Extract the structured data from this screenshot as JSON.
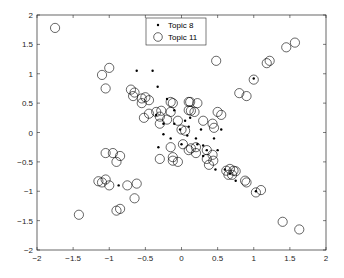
{
  "chart_data": {
    "type": "scatter",
    "title": "",
    "xlabel": "",
    "ylabel": "",
    "xlim": [
      -2,
      2
    ],
    "ylim": [
      -2,
      2
    ],
    "xticks": [
      "-2",
      "-1.5",
      "-1",
      "-0.5",
      "0",
      "0.5",
      "1",
      "1.5",
      "2"
    ],
    "yticks": [
      "-2",
      "-1.5",
      "-1",
      "-0.5",
      "0",
      "0.5",
      "1",
      "1.5",
      "2"
    ],
    "grid": false,
    "legend_position": "top-center",
    "series": [
      {
        "name": "Topic 8",
        "marker": "dot",
        "points": [
          [
            -0.62,
            1.05
          ],
          [
            -0.4,
            1.05
          ],
          [
            -0.33,
            0.78
          ],
          [
            -0.2,
            0.57
          ],
          [
            -0.1,
            0.38
          ],
          [
            -0.35,
            0.3
          ],
          [
            -0.25,
            0.15
          ],
          [
            -0.1,
            0.15
          ],
          [
            0.05,
            0.2
          ],
          [
            0.1,
            0.1
          ],
          [
            -0.25,
            -0.03
          ],
          [
            0.08,
            -0.05
          ],
          [
            0.2,
            -0.1
          ],
          [
            0.27,
            0.05
          ],
          [
            0.22,
            -0.2
          ],
          [
            0.3,
            -0.22
          ],
          [
            0.35,
            -0.3
          ],
          [
            0.45,
            -0.1
          ],
          [
            0.55,
            0.05
          ],
          [
            0.5,
            -0.3
          ],
          [
            0.3,
            -0.4
          ],
          [
            0.47,
            -0.63
          ],
          [
            0.6,
            -0.63
          ],
          [
            0.67,
            -0.7
          ],
          [
            0.75,
            -0.82
          ],
          [
            1.03,
            -1.0
          ],
          [
            1.0,
            0.92
          ],
          [
            -0.32,
            -0.25
          ],
          [
            -0.87,
            -0.9
          ],
          [
            -0.15,
            -0.1
          ],
          [
            0.0,
            -0.2
          ],
          [
            -0.02,
            0.05
          ],
          [
            0.12,
            0.25
          ]
        ]
      },
      {
        "name": "Topic 11",
        "marker": "circle",
        "points": [
          [
            -1.75,
            1.78
          ],
          [
            -1.0,
            1.1
          ],
          [
            -1.1,
            0.98
          ],
          [
            -1.05,
            0.75
          ],
          [
            -0.7,
            0.73
          ],
          [
            -0.65,
            0.68
          ],
          [
            -0.67,
            0.62
          ],
          [
            -0.55,
            0.58
          ],
          [
            -0.5,
            0.6
          ],
          [
            -0.45,
            0.55
          ],
          [
            -0.55,
            0.5
          ],
          [
            -0.35,
            0.35
          ],
          [
            -0.28,
            0.37
          ],
          [
            -0.3,
            0.27
          ],
          [
            -0.15,
            0.52
          ],
          [
            -0.12,
            0.5
          ],
          [
            -0.15,
            0.35
          ],
          [
            -0.2,
            0.22
          ],
          [
            -0.3,
            0.15
          ],
          [
            -0.45,
            0.32
          ],
          [
            -0.52,
            0.25
          ],
          [
            -0.05,
            0.2
          ],
          [
            0.0,
            0.05
          ],
          [
            0.05,
            0.03
          ],
          [
            0.1,
            0.52
          ],
          [
            0.12,
            0.52
          ],
          [
            0.1,
            0.38
          ],
          [
            0.13,
            0.37
          ],
          [
            0.22,
            0.5
          ],
          [
            0.18,
            0.35
          ],
          [
            0.3,
            0.2
          ],
          [
            0.43,
            0.15
          ],
          [
            0.45,
            0.08
          ],
          [
            0.5,
            0.35
          ],
          [
            0.55,
            0.3
          ],
          [
            0.02,
            -0.2
          ],
          [
            0.1,
            -0.3
          ],
          [
            0.13,
            -0.27
          ],
          [
            0.2,
            -0.25
          ],
          [
            0.2,
            -0.35
          ],
          [
            0.35,
            -0.3
          ],
          [
            0.35,
            -0.45
          ],
          [
            0.43,
            -0.38
          ],
          [
            0.44,
            -0.48
          ],
          [
            0.38,
            -0.55
          ],
          [
            0.62,
            -0.65
          ],
          [
            0.67,
            -0.62
          ],
          [
            0.72,
            -0.65
          ],
          [
            0.65,
            -0.72
          ],
          [
            0.7,
            -0.72
          ],
          [
            0.75,
            -0.66
          ],
          [
            0.88,
            -0.82
          ],
          [
            0.9,
            -0.85
          ],
          [
            1.03,
            -1.02
          ],
          [
            1.1,
            -0.98
          ],
          [
            1.4,
            -1.52
          ],
          [
            1.63,
            -1.65
          ],
          [
            0.48,
            1.22
          ],
          [
            0.8,
            0.67
          ],
          [
            0.9,
            0.62
          ],
          [
            1.0,
            0.9
          ],
          [
            1.18,
            1.18
          ],
          [
            1.22,
            1.22
          ],
          [
            1.45,
            1.45
          ],
          [
            1.57,
            1.53
          ],
          [
            -1.05,
            -0.35
          ],
          [
            -0.95,
            -0.35
          ],
          [
            -0.85,
            -0.4
          ],
          [
            -0.9,
            -0.5
          ],
          [
            -1.05,
            -0.8
          ],
          [
            -1.1,
            -0.85
          ],
          [
            -1.0,
            -0.9
          ],
          [
            -0.75,
            -0.9
          ],
          [
            -0.62,
            -0.87
          ],
          [
            -0.65,
            -1.12
          ],
          [
            -0.85,
            -1.3
          ],
          [
            -0.9,
            -1.33
          ],
          [
            -1.42,
            -1.4
          ],
          [
            -0.15,
            -0.25
          ],
          [
            -0.12,
            -0.42
          ],
          [
            -0.12,
            -0.48
          ],
          [
            -0.05,
            -0.5
          ],
          [
            -1.15,
            -0.83
          ],
          [
            -0.3,
            -0.45
          ]
        ]
      }
    ]
  },
  "legend": {
    "items": [
      {
        "label": "Topic 8",
        "marker": "dot"
      },
      {
        "label": "Topic 11",
        "marker": "circle"
      }
    ]
  },
  "colors": {
    "markers": "#000000",
    "axes": "#262626",
    "background": "#ffffff"
  }
}
